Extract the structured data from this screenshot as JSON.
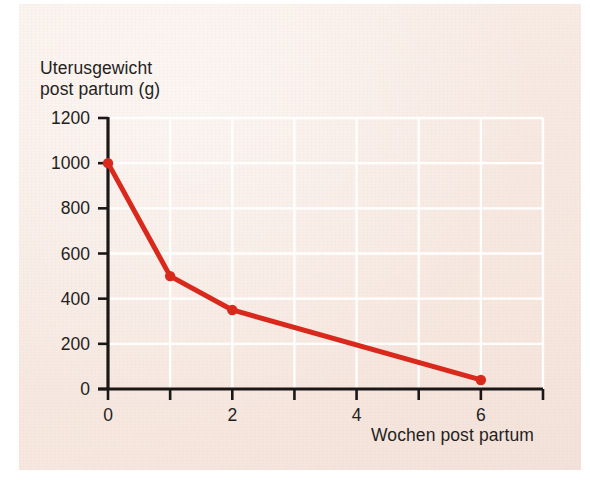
{
  "figure": {
    "background_color": "#f6e8e0",
    "page_color": "#ffffff"
  },
  "chart_data": {
    "type": "line",
    "title": "",
    "ylabel": "Uterusgewicht\npost partum (g)",
    "xlabel": "Wochen post partum",
    "x": [
      0,
      1,
      2,
      6
    ],
    "values": [
      1000,
      500,
      350,
      40
    ],
    "series": [
      {
        "name": "Uterusgewicht post partum (g)",
        "x": [
          0,
          1,
          2,
          6
        ],
        "values": [
          1000,
          500,
          350,
          40
        ],
        "color": "#d8291c",
        "marker": "circle"
      }
    ],
    "xlim": [
      0,
      7
    ],
    "ylim": [
      0,
      1200
    ],
    "xticks": [
      0,
      1,
      2,
      3,
      4,
      5,
      6,
      7
    ],
    "xtick_labels": [
      "0",
      "",
      "2",
      "",
      "4",
      "",
      "6",
      ""
    ],
    "yticks": [
      0,
      200,
      400,
      600,
      800,
      1000,
      1200
    ],
    "ytick_labels": [
      "0",
      "200",
      "400",
      "600",
      "800",
      "1000",
      "1200"
    ],
    "grid": true,
    "grid_color": "#ffffff",
    "legend": null,
    "axis_color": "#1b1717",
    "annotations": []
  }
}
